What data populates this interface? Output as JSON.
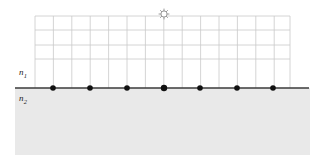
{
  "figure": {
    "type": "optics-wavefront-diagram",
    "labels": {
      "upper_medium": "n",
      "upper_medium_sub": "1",
      "lower_medium": "n",
      "lower_medium_sub": "2"
    },
    "colors": {
      "grid_line": "#c9c9c9",
      "interface_line": "#3a3a3a",
      "point": "#111111",
      "lower_medium_fill": "#ececec",
      "source_outline": "#9a9a9a",
      "background": "#ffffff"
    },
    "grid": {
      "left": 35,
      "right": 290,
      "top": 16,
      "bottom": 88,
      "vertical_spacing": 18.4,
      "vertical_x": [
        35,
        53.4,
        71.8,
        90.2,
        108.6,
        127,
        145.4,
        163.8,
        182.2,
        200.6,
        219,
        237.4,
        255.8,
        274.2,
        290
      ],
      "horizontal_y": [
        16,
        30,
        45,
        59
      ]
    },
    "interface": {
      "y": 88,
      "x_start": 15,
      "x_end": 309
    },
    "lower_medium_region": {
      "x": 15,
      "y": 88,
      "width": 295,
      "height": 67
    },
    "source": {
      "name": "point-light-source",
      "x": 164,
      "y": 14,
      "radius": 4.2,
      "spikes": 8
    },
    "interface_points": {
      "count": 7,
      "radius": 2.8,
      "x": [
        53,
        90,
        127,
        164,
        200,
        237,
        273
      ],
      "y": 88
    }
  }
}
